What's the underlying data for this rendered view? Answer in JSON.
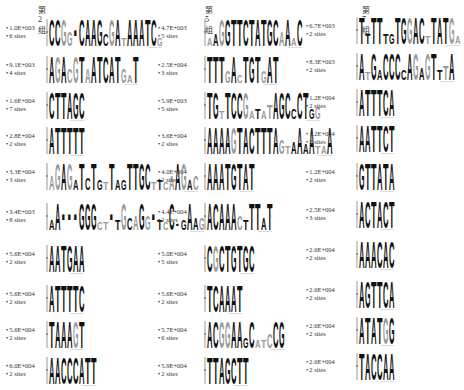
{
  "groups": [
    {
      "title": "第2组",
      "motifs": [
        {
          "evalue": "1.0E+003",
          "sites": "6 sites",
          "sequence": "CCGGNCAAGCGATAAATCG"
        },
        {
          "evalue": "9.1E+003",
          "sites": "4 sites",
          "sequence": "AGACGTAATCATGAT"
        },
        {
          "evalue": "1.6E+004",
          "sites": "7 sites",
          "sequence": "CTTAGC"
        },
        {
          "evalue": "2.8E+004",
          "sites": "2 sites",
          "sequence": "ATTTTT"
        },
        {
          "evalue": "3.3E+004",
          "sites": "3 sites",
          "sequence": "AGAGATCTGTTAGTTGCTTCAAGAC"
        },
        {
          "evalue": "3.4E+003",
          "sites": "8 sites",
          "sequence": "AANNNGGGCTNTGCAGGNTCCNGAAG"
        },
        {
          "evalue": "5.6E+004",
          "sites": "2 sites",
          "sequence": "AATGAA"
        },
        {
          "evalue": "5.6E+004",
          "sites": "2 sites",
          "sequence": "ATTTTC"
        },
        {
          "evalue": "5.6E+004",
          "sites": "2 sites",
          "sequence": "TAAAGT"
        },
        {
          "evalue": "6.0E+004",
          "sites": "2 sites",
          "sequence": "AACCCATT"
        }
      ]
    },
    {
      "title": "第5组",
      "motifs": [
        {
          "evalue": "4.7E+003",
          "sites": "5 sites",
          "sequence": "AAGGTTCTATGCAAAC"
        },
        {
          "evalue": "2.5E+004",
          "sites": "3 sites",
          "sequence": "TTTGACTGTGAT"
        },
        {
          "evalue": "5.9E+003",
          "sites": "5 sites",
          "sequence": "TGTTCCGATATAGCCCTGG"
        },
        {
          "evalue": "3.6E+004",
          "sites": "2 sites",
          "sequence": "AAAAGTACTTTAGTAAAATAA"
        },
        {
          "evalue": "4.0E+004",
          "sites": "2 sites",
          "sequence": "AAATGTAT"
        },
        {
          "evalue": "4.4E+004",
          "sites": "2 sites",
          "sequence": "ACAAACTTTAT"
        },
        {
          "evalue": "5.0E+004",
          "sites": "5 sites",
          "sequence": "CGCTGTGC"
        },
        {
          "evalue": "5.6E+004",
          "sites": "2 sites",
          "sequence": "TCAAAT"
        },
        {
          "evalue": "5.7E+004",
          "sites": "6 sites",
          "sequence": "ACGGAAGCATCCG"
        },
        {
          "evalue": "5.9E+004",
          "sites": "2 sites",
          "sequence": "TTAGCTT"
        }
      ]
    },
    {
      "title": "第7组",
      "motifs": [
        {
          "evalue": "6.7E+003",
          "sites": "2 sites",
          "sequence": "TTTTTGTGGACTTATGA"
        },
        {
          "evalue": "8.3E+003",
          "sites": "2 sites",
          "sequence": "ATGACCCCAGAGTTTA"
        },
        {
          "evalue": "1.2E+004",
          "sites": "2 sites",
          "sequence": "ATTTCA"
        },
        {
          "evalue": "1.2E+004",
          "sites": "2 sites",
          "sequence": "AATTCT"
        },
        {
          "evalue": "1.2E+004",
          "sites": "2 sites",
          "sequence": "GTTATA"
        },
        {
          "evalue": "2.5E+004",
          "sites": "3 sites",
          "sequence": "ACTACT"
        },
        {
          "evalue": "2.6E+004",
          "sites": "2 sites",
          "sequence": "AAACAC"
        },
        {
          "evalue": "2.6E+004",
          "sites": "2 sites",
          "sequence": "AGTTCA"
        },
        {
          "evalue": "2.6E+004",
          "sites": "2 sites",
          "sequence": "ATATGG"
        },
        {
          "evalue": "2.6E+004",
          "sites": "2 sites",
          "sequence": "TACCAA"
        }
      ]
    }
  ],
  "colors": {
    "text": "#222222",
    "logo_dark": "#111111",
    "logo_gray": "#9a9a9a"
  }
}
